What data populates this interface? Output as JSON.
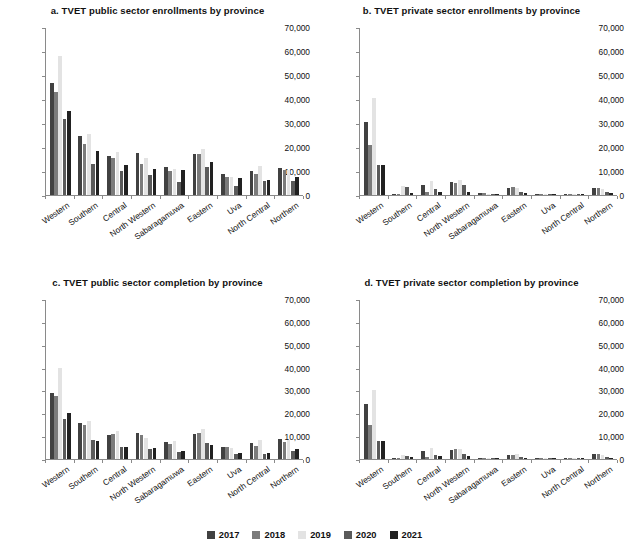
{
  "figure": {
    "categories": [
      "Western",
      "Southern",
      "Central",
      "North Western",
      "Sabaragamuwa",
      "Eastern",
      "Uva",
      "North Central",
      "Northern"
    ],
    "ylim": [
      0,
      70000
    ],
    "yticks": [
      0,
      10000,
      20000,
      30000,
      40000,
      50000,
      60000,
      70000
    ],
    "ytick_labels": [
      "0",
      "10,000",
      "20,000",
      "30,000",
      "40,000",
      "50,000",
      "60,000",
      "70,000"
    ],
    "legend": {
      "position": "bottom-center",
      "entries": [
        {
          "label": "2017",
          "color": "#414141"
        },
        {
          "label": "2018",
          "color": "#7b7b7b"
        },
        {
          "label": "2019",
          "color": "#e3e3e3"
        },
        {
          "label": "2020",
          "color": "#5a5a5a"
        },
        {
          "label": "2021",
          "color": "#212121"
        }
      ]
    }
  },
  "chart_data": [
    {
      "type": "bar",
      "title": "a. TVET public sector enrollments by province",
      "xlabel": "",
      "ylabel": "",
      "ylim": [
        0,
        70000
      ],
      "grid": false,
      "categories": [
        "Western",
        "Southern",
        "Central",
        "North Western",
        "Sabaragamuwa",
        "Eastern",
        "Uva",
        "North Central",
        "Northern"
      ],
      "series": [
        {
          "name": "2017",
          "values": [
            46500,
            24500,
            16300,
            17700,
            11600,
            17000,
            8900,
            10000,
            11400
          ]
        },
        {
          "name": "2018",
          "values": [
            43000,
            21300,
            15500,
            13000,
            9900,
            16900,
            7400,
            8700,
            10600
          ]
        },
        {
          "name": "2019",
          "values": [
            58000,
            25500,
            18000,
            15400,
            10900,
            19200,
            7600,
            11900,
            10400
          ]
        },
        {
          "name": "2020",
          "values": [
            31700,
            13000,
            10200,
            8400,
            5400,
            11800,
            3800,
            5800,
            6000
          ]
        },
        {
          "name": "2021",
          "values": [
            34900,
            18300,
            12400,
            10900,
            10300,
            13600,
            7000,
            6200,
            7700
          ]
        }
      ]
    },
    {
      "type": "bar",
      "title": "b. TVET private sector enrollments by province",
      "xlabel": "",
      "ylabel": "",
      "ylim": [
        0,
        70000
      ],
      "grid": false,
      "categories": [
        "Western",
        "Southern",
        "Central",
        "North Western",
        "Sabaragamuwa",
        "Eastern",
        "Uva",
        "North Central",
        "Northern"
      ],
      "series": [
        {
          "name": "2017",
          "values": [
            30400,
            300,
            4000,
            5400,
            700,
            2800,
            300,
            400,
            3100
          ]
        },
        {
          "name": "2018",
          "values": [
            20700,
            300,
            1100,
            5100,
            800,
            3200,
            400,
            200,
            3000
          ]
        },
        {
          "name": "2019",
          "values": [
            40500,
            3600,
            6000,
            6300,
            500,
            2800,
            300,
            200,
            2500
          ]
        },
        {
          "name": "2020",
          "values": [
            12700,
            3300,
            2500,
            4000,
            300,
            1100,
            200,
            100,
            1400
          ]
        },
        {
          "name": "2021",
          "values": [
            12300,
            900,
            1300,
            1400,
            600,
            900,
            200,
            100,
            700
          ]
        }
      ]
    },
    {
      "type": "bar",
      "title": "c. TVET public sector completion by province",
      "xlabel": "",
      "ylabel": "",
      "ylim": [
        0,
        70000
      ],
      "grid": false,
      "categories": [
        "Western",
        "Southern",
        "Central",
        "North Western",
        "Sabaragamuwa",
        "Eastern",
        "Uva",
        "North Central",
        "Northern"
      ],
      "series": [
        {
          "name": "2017",
          "values": [
            28900,
            15900,
            10500,
            11500,
            7400,
            11000,
            5200,
            6800,
            8600
          ]
        },
        {
          "name": "2018",
          "values": [
            27600,
            15000,
            10900,
            10500,
            6400,
            11400,
            5400,
            5800,
            7600
          ]
        },
        {
          "name": "2019",
          "values": [
            39800,
            16600,
            12100,
            9400,
            7800,
            13000,
            4700,
            8200,
            8200
          ]
        },
        {
          "name": "2020",
          "values": [
            17700,
            8400,
            5200,
            4500,
            2900,
            7000,
            2400,
            2400,
            3700
          ]
        },
        {
          "name": "2021",
          "values": [
            20100,
            8000,
            5400,
            4700,
            3400,
            6300,
            2700,
            2700,
            4400
          ]
        }
      ]
    },
    {
      "type": "bar",
      "title": "d. TVET private sector completion by province",
      "xlabel": "",
      "ylabel": "",
      "ylim": [
        0,
        70000
      ],
      "grid": false,
      "categories": [
        "Western",
        "Southern",
        "Central",
        "North Western",
        "Sabaragamuwa",
        "Eastern",
        "Uva",
        "North Central",
        "Northern"
      ],
      "series": [
        {
          "name": "2017",
          "values": [
            24000,
            300,
            3500,
            4100,
            400,
            1900,
            200,
            100,
            2200
          ]
        },
        {
          "name": "2018",
          "values": [
            14700,
            300,
            1000,
            4200,
            500,
            1900,
            300,
            100,
            2200
          ]
        },
        {
          "name": "2019",
          "values": [
            30200,
            1800,
            4700,
            4400,
            300,
            2300,
            200,
            100,
            1800
          ]
        },
        {
          "name": "2020",
          "values": [
            7900,
            1500,
            1900,
            2200,
            200,
            700,
            100,
            100,
            700
          ]
        },
        {
          "name": "2021",
          "values": [
            7700,
            700,
            1200,
            1200,
            400,
            500,
            100,
            100,
            400
          ]
        }
      ]
    }
  ]
}
